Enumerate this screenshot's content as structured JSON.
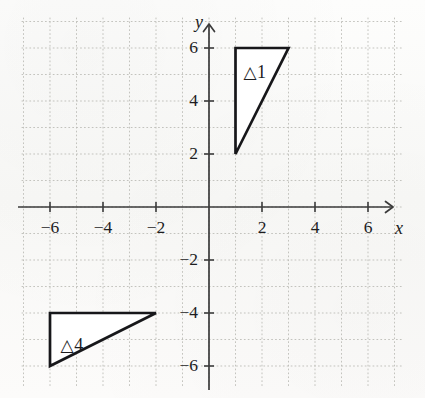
{
  "figure": {
    "type": "coordinate-plane",
    "background_color": "#fbfbfa",
    "axis_color": "#3b3b3b",
    "grid_color": "#b9b9b4",
    "shape_stroke_color": "#17171a",
    "shape_fill_color": "#ffffff"
  },
  "chart_data": {
    "type": "scatter",
    "title": "",
    "xlabel": "x",
    "ylabel": "y",
    "xlim": [
      -7,
      7
    ],
    "ylim": [
      -7,
      7
    ],
    "grid": true,
    "grid_step": 1,
    "legend": "none",
    "x_ticks": [
      -6,
      -4,
      -2,
      2,
      4,
      6
    ],
    "y_ticks": [
      6,
      4,
      2,
      -2,
      -4,
      -6
    ],
    "x_tick_labels": [
      "−6",
      "−4",
      "−2",
      "2",
      "4",
      "6"
    ],
    "y_tick_labels": [
      "6",
      "4",
      "2",
      "−2",
      "−4",
      "−6"
    ],
    "shapes": [
      {
        "name": "triangle-1",
        "label": "△1",
        "label_glyph": "△",
        "label_number": "1",
        "vertices": [
          [
            1,
            6
          ],
          [
            3,
            6
          ],
          [
            1,
            2
          ]
        ],
        "label_position": [
          1.3,
          5.45
        ]
      },
      {
        "name": "triangle-4",
        "label": "△4",
        "label_glyph": "△",
        "label_number": "4",
        "vertices": [
          [
            -6,
            -4
          ],
          [
            -2,
            -4
          ],
          [
            -6,
            -6
          ]
        ],
        "label_position": [
          -5.6,
          -4.85
        ]
      }
    ]
  },
  "axes": {
    "x_axis_label": "x",
    "y_axis_label": "y"
  }
}
